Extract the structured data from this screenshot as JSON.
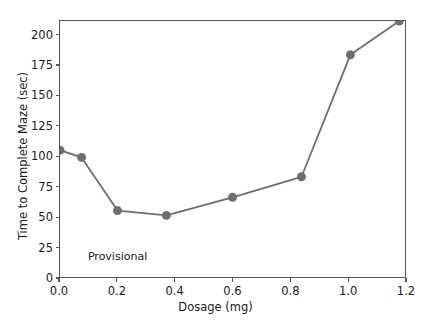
{
  "chart_data": {
    "type": "line",
    "title": "",
    "xlabel": "Dosage (mg)",
    "ylabel": "Time to Complete Maze (sec)",
    "xlim": [
      0.0,
      1.2
    ],
    "ylim": [
      0,
      212
    ],
    "grid": false,
    "legend": null,
    "x": [
      0.0,
      0.075,
      0.2,
      0.37,
      0.6,
      0.84,
      1.01,
      1.18
    ],
    "values": [
      105,
      99,
      55,
      51,
      66,
      83,
      184,
      212
    ],
    "points": [
      {
        "x": 0.0,
        "y": 105
      },
      {
        "x": 0.075,
        "y": 99
      },
      {
        "x": 0.2,
        "y": 55
      },
      {
        "x": 0.37,
        "y": 51
      },
      {
        "x": 0.6,
        "y": 66
      },
      {
        "x": 0.84,
        "y": 83
      },
      {
        "x": 1.01,
        "y": 184
      },
      {
        "x": 1.18,
        "y": 212
      }
    ],
    "xticks": [
      0.0,
      0.2,
      0.4,
      0.6,
      0.8,
      1.0,
      1.2
    ],
    "xticklabels": [
      "0.0",
      "0.2",
      "0.4",
      "0.6",
      "0.8",
      "1.0",
      "1.2"
    ],
    "yticks": [
      0,
      25,
      50,
      75,
      100,
      125,
      150,
      175,
      200
    ],
    "yticklabels": [
      "0",
      "25",
      "50",
      "75",
      "100",
      "125",
      "150",
      "175",
      "200"
    ],
    "annotations": [
      {
        "text": "Provisional",
        "x": 0.1,
        "y": 17
      }
    ],
    "series_color": "#6e6e6e",
    "marker": "circle",
    "marker_size": 9,
    "line_width": 1.8,
    "axis_color": "#555555",
    "text_color": "#1a1a1a",
    "background": "#ffffff"
  }
}
